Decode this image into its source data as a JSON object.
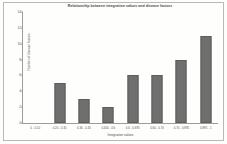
{
  "figure": {
    "background_color": "#fdfdfc",
    "border_color": "#b9b9b5"
  },
  "chart_data": {
    "type": "bar",
    "title": "Relationship between integration values and disease factors",
    "xlabel": "Integration values",
    "ylabel": "Number of disease factors",
    "categories": [
      "0 - 0.10",
      "0.20 - 0.30",
      "0.30 - 0.45",
      "0.450 - 0.6",
      "0.6 - 0.695",
      "0.60 - 0.70",
      "0.70 - 0.895",
      "0.895 - 1"
    ],
    "values": [
      0,
      5,
      3,
      2,
      6,
      6,
      8,
      11
    ],
    "ylim": [
      0,
      14
    ],
    "yticks": [
      0,
      2,
      4,
      6,
      8,
      10,
      12,
      14
    ],
    "ytick_labels": [
      "0",
      "2",
      "4",
      "6",
      "8",
      "10",
      "12",
      "14"
    ],
    "bar_color": "#6f6f6f",
    "bar_edge_color": "#5d5d5d",
    "grid": false,
    "legend": "none"
  }
}
